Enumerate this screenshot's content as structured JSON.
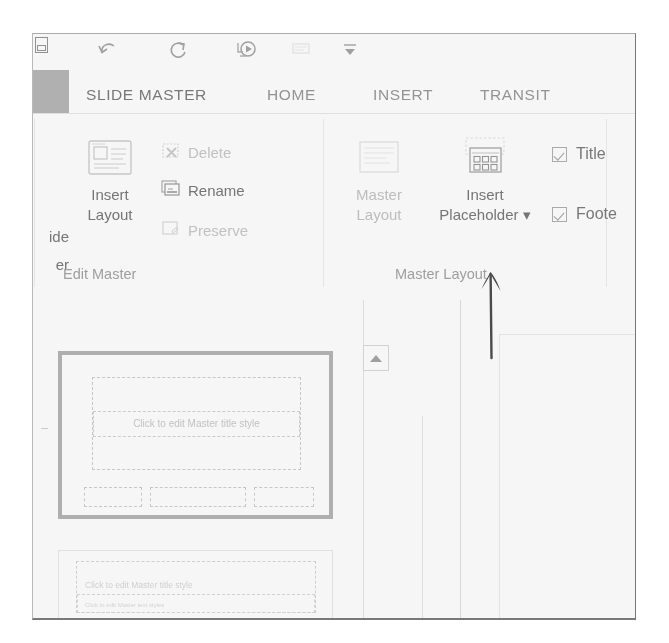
{
  "app": {
    "name": "PowerPoint Slide Master View",
    "file_tab_label": ""
  },
  "quick_access_toolbar": {
    "items": [
      {
        "name": "save",
        "icon": "save-icon",
        "state": "enabled"
      },
      {
        "name": "undo",
        "icon": "undo-icon",
        "state": "enabled"
      },
      {
        "name": "redo",
        "icon": "redo-icon",
        "state": "enabled"
      },
      {
        "name": "start-from-beginning",
        "icon": "start-slideshow-icon",
        "state": "enabled"
      },
      {
        "name": "touch-mouse-mode",
        "icon": "touch-mode-icon",
        "state": "disabled"
      },
      {
        "name": "customize-quick-access-toolbar",
        "icon": "chevron-down-icon",
        "state": "enabled"
      }
    ]
  },
  "ribbon": {
    "tabs": [
      {
        "label": "SLIDE MASTER",
        "active": true
      },
      {
        "label": "HOME",
        "active": false
      },
      {
        "label": "INSERT",
        "active": false
      },
      {
        "label": "TRANSIT",
        "active": false
      }
    ],
    "groups": [
      {
        "id": "edit-master",
        "label": "Edit Master",
        "clipped_button": {
          "line1": "ide",
          "line2": "er"
        },
        "big_buttons": [
          {
            "label_line1": "Insert",
            "label_line2": "Layout",
            "enabled": true,
            "icon": "insert-layout-icon"
          }
        ],
        "small_buttons": [
          {
            "label": "Delete",
            "enabled": false,
            "icon": "delete-slide-icon"
          },
          {
            "label": "Rename",
            "enabled": true,
            "icon": "rename-icon"
          },
          {
            "label": "Preserve",
            "enabled": false,
            "icon": "preserve-icon"
          }
        ]
      },
      {
        "id": "master-layout",
        "label": "Master Layout",
        "big_buttons": [
          {
            "label_line1": "Master",
            "label_line2": "Layout",
            "enabled": false,
            "icon": "master-layout-icon"
          },
          {
            "label_line1": "Insert",
            "label_line2": "Placeholder ▾",
            "enabled": true,
            "icon": "insert-placeholder-icon"
          }
        ],
        "checkboxes": [
          {
            "label": "Title",
            "checked": true
          },
          {
            "label": "Foote",
            "checked": true
          }
        ]
      }
    ]
  },
  "workspace": {
    "scroll_up_button": {
      "icon": "triangle-up-icon"
    },
    "thumbnails": [
      {
        "id": "slide-master",
        "selected": true,
        "title_placeholder_text": "Click to edit Master title style",
        "footer_placeholders": [
          "",
          "",
          ""
        ]
      },
      {
        "id": "layout-1",
        "selected": false,
        "title_placeholder_text": "Click to edit Master title style",
        "subtitle_placeholder_text": "Click to edit Master text styles"
      }
    ]
  },
  "annotation": {
    "type": "hand-drawn-arrow",
    "direction": "up",
    "points_to": "Insert Placeholder"
  },
  "colors": {
    "ink": "#6b6b6b",
    "disabled": "#c2c2c2",
    "group_label": "#9a9a9a",
    "selection_border": "#adadad",
    "annotation": "#3a3a3a"
  }
}
